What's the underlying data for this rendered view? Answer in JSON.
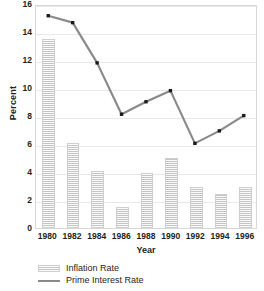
{
  "chart_data": {
    "type": "bar",
    "title": "",
    "xlabel": "Year",
    "ylabel": "Percent",
    "categories": [
      "1980",
      "1982",
      "1984",
      "1986",
      "1988",
      "1990",
      "1992",
      "1994",
      "1996"
    ],
    "ylim": [
      0,
      16
    ],
    "ytick_values": [
      0,
      2,
      4,
      6,
      8,
      10,
      12,
      14,
      16
    ],
    "ytick_labels": [
      "0",
      "2",
      "4",
      "6",
      "8",
      "10",
      "12",
      "14",
      "16"
    ],
    "grid": true,
    "legend_position": "below-left",
    "series": [
      {
        "name": "Inflation Rate",
        "type": "bar",
        "color": "#dedede",
        "values": [
          13.5,
          6.1,
          4.1,
          1.5,
          3.9,
          5.0,
          2.9,
          2.4,
          2.9
        ]
      },
      {
        "name": "Prime Interest Rate",
        "type": "line",
        "color": "#8a8a8a",
        "marker_color": "#1a1a1a",
        "values": [
          15.3,
          14.8,
          11.9,
          8.2,
          9.1,
          9.9,
          6.1,
          7.0,
          8.1
        ]
      }
    ]
  },
  "axes": {
    "y_title": "Percent",
    "x_title": "Year"
  },
  "legend": {
    "items": [
      {
        "label": "Inflation Rate",
        "swatch": "hatched-bar-swatch"
      },
      {
        "label": "Prime Interest Rate",
        "swatch": "line-swatch"
      }
    ]
  }
}
